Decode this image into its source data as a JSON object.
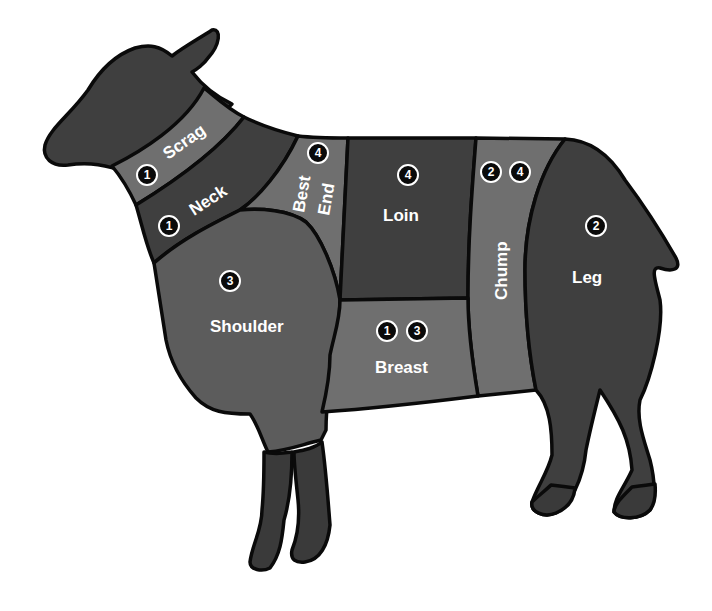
{
  "colors": {
    "dark": "#3f3f3f",
    "medium": "#5c5c5c",
    "light": "#6f6f6f",
    "outline": "#0a0a0a",
    "badge_fill": "#0a0a0a",
    "label_text": "#ffffff",
    "background": "#ffffff"
  },
  "cuts": [
    {
      "id": "scrag",
      "label": "Scrag",
      "badges": [
        "1"
      ],
      "shade": "light"
    },
    {
      "id": "neck",
      "label": "Neck",
      "badges": [
        "1"
      ],
      "shade": "dark"
    },
    {
      "id": "best-end",
      "label_line1": "Best",
      "label_line2": "End",
      "badges": [
        "4"
      ],
      "shade": "light"
    },
    {
      "id": "loin",
      "label": "Loin",
      "badges": [
        "4"
      ],
      "shade": "dark"
    },
    {
      "id": "chump",
      "label": "Chump",
      "badges": [
        "2",
        "4"
      ],
      "shade": "light"
    },
    {
      "id": "leg",
      "label": "Leg",
      "badges": [
        "2"
      ],
      "shade": "dark"
    },
    {
      "id": "shoulder",
      "label": "Shoulder",
      "badges": [
        "3"
      ],
      "shade": "medium"
    },
    {
      "id": "breast",
      "label": "Breast",
      "badges": [
        "1",
        "3"
      ],
      "shade": "light"
    }
  ],
  "regions": [
    "head",
    "shanks-front",
    "shanks-rear"
  ]
}
